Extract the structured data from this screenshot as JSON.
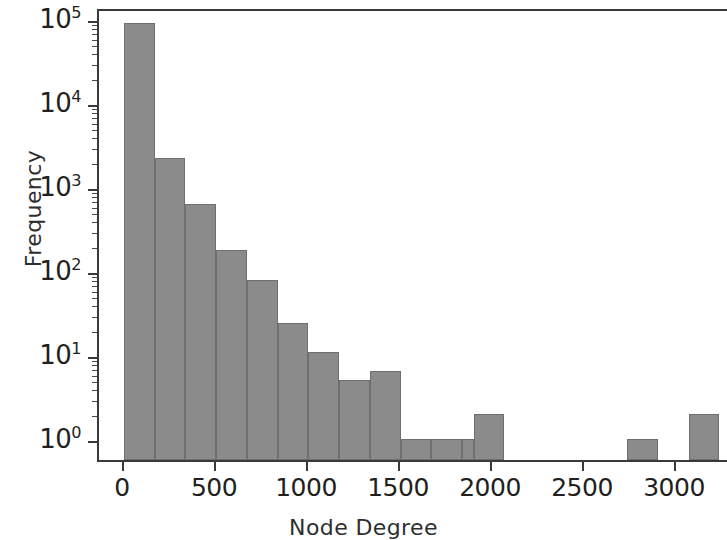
{
  "chart_data": {
    "type": "bar",
    "title": "",
    "subtitle": "",
    "xlabel": "Node Degree",
    "ylabel": "Frequency",
    "yscale": "log",
    "xscale": "linear",
    "xlim": [
      -130,
      3270
    ],
    "ylim": [
      1,
      130000
    ],
    "grid": false,
    "legend": null,
    "bin_width": 167,
    "y_tick_labels": [
      "10",
      "10",
      "10",
      "10",
      "10",
      "10"
    ],
    "y_tick_exponents": [
      "0",
      "1",
      "2",
      "3",
      "4",
      "5"
    ],
    "y_tick_values": [
      1,
      10,
      100,
      1000,
      10000,
      100000
    ],
    "x_tick_labels": [
      "0",
      "500",
      "1000",
      "1500",
      "2000",
      "2500",
      "3000"
    ],
    "x_tick_values": [
      0,
      500,
      1000,
      1500,
      2000,
      2500,
      3000
    ],
    "bar_color": "#8b8b8b",
    "bar_edge_color": "#6f6f6f",
    "axis_color": "#3a3a3a",
    "bins": [
      {
        "x0": 0,
        "x1": 167,
        "value": 90000
      },
      {
        "x0": 167,
        "x1": 334,
        "value": 2200
      },
      {
        "x0": 334,
        "x1": 501,
        "value": 620
      },
      {
        "x0": 501,
        "x1": 668,
        "value": 180
      },
      {
        "x0": 668,
        "x1": 835,
        "value": 78
      },
      {
        "x0": 835,
        "x1": 1002,
        "value": 24
      },
      {
        "x0": 1002,
        "x1": 1169,
        "value": 11
      },
      {
        "x0": 1169,
        "x1": 1336,
        "value": 5
      },
      {
        "x0": 1336,
        "x1": 1503,
        "value": 6.5
      },
      {
        "x0": 1503,
        "x1": 1670,
        "value": 1
      },
      {
        "x0": 1670,
        "x1": 1837,
        "value": 1
      },
      {
        "x0": 1837,
        "x1": 1900,
        "value": 1
      },
      {
        "x0": 1900,
        "x1": 2067,
        "value": 2
      },
      {
        "x0": 2067,
        "x1": 2734,
        "value": 0
      },
      {
        "x0": 2734,
        "x1": 2901,
        "value": 1
      },
      {
        "x0": 2901,
        "x1": 3068,
        "value": 0
      },
      {
        "x0": 3068,
        "x1": 3235,
        "value": 2
      }
    ],
    "categories": [
      "0-167",
      "167-334",
      "334-501",
      "501-668",
      "668-835",
      "835-1002",
      "1002-1169",
      "1169-1336",
      "1336-1503",
      "1503-1670",
      "1670-1837",
      "1837-1900",
      "1900-2067",
      "2067-2734",
      "2734-2901",
      "2901-3068",
      "3068-3235"
    ],
    "values": [
      90000,
      2200,
      620,
      180,
      78,
      24,
      11,
      5,
      6.5,
      1,
      1,
      1,
      2,
      0,
      1,
      0,
      2
    ]
  }
}
